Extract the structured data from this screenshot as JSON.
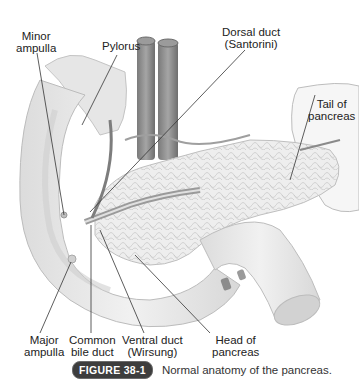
{
  "figure": {
    "labels": {
      "minor_ampulla": [
        "Minor",
        "ampulla"
      ],
      "pylorus": [
        "Pylorus"
      ],
      "dorsal_duct": [
        "Dorsal duct",
        "(Santorini)"
      ],
      "tail_of_pancreas": [
        "Tail of",
        "pancreas"
      ],
      "major_ampulla": [
        "Major",
        "ampulla"
      ],
      "common_bile_duct": [
        "Common",
        "bile duct"
      ],
      "ventral_duct": [
        "Ventral duct",
        "(Wirsung)"
      ],
      "head_of_pancreas": [
        "Head of",
        "pancreas"
      ]
    },
    "caption": {
      "badge": "FIGURE 38-1",
      "text": "Normal anatomy of the pancreas."
    },
    "colors": {
      "badge_bg": "#3d3d3d",
      "organ_light": "#e9e9e9",
      "organ_mid": "#d4d4d4",
      "vessel": "#8a8a8a",
      "leader_line": "#333333"
    }
  }
}
